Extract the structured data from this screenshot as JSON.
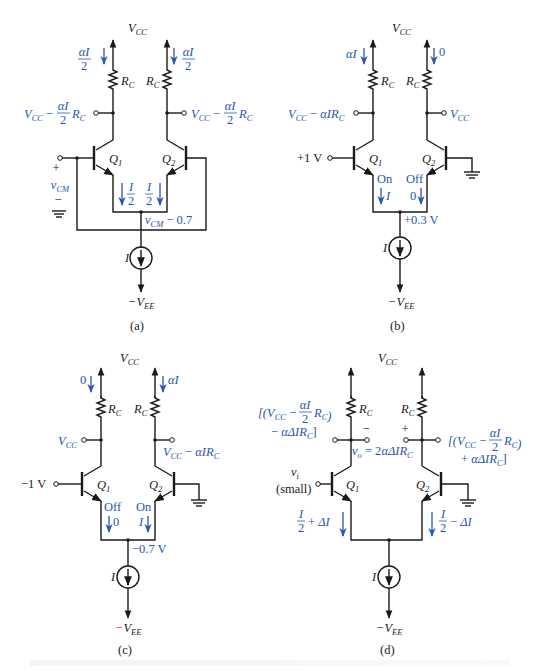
{
  "figure": {
    "panels": [
      {
        "id": "a",
        "caption": "(a)",
        "supply_top": "V",
        "supply_top_sub": "CC",
        "supply_bottom": "−V",
        "supply_bottom_sub": "EE",
        "left_rc": "R",
        "right_rc": "R",
        "rc_sub": "C",
        "q1": "Q",
        "q1_sub": "1",
        "q2": "Q",
        "q2_sub": "2",
        "left_collector_current": "αI/2",
        "right_collector_current": "αI/2",
        "left_collector_voltage": "V_CC − (αI/2) R_C",
        "right_collector_voltage": "V_CC − (αI/2) R_C",
        "left_emitter_current": "I/2",
        "right_emitter_current": "I/2",
        "emitter_node_voltage": "v_CM − 0.7",
        "input_label": "v_CM",
        "input_plus": "+",
        "input_minus": "−",
        "source_label": "I"
      },
      {
        "id": "b",
        "caption": "(b)",
        "supply_top": "V",
        "supply_top_sub": "CC",
        "supply_bottom": "−V",
        "supply_bottom_sub": "EE",
        "left_collector_current": "αI",
        "right_collector_current": "0",
        "left_collector_voltage": "V_CC − αIR_C",
        "right_collector_voltage": "V_CC",
        "input_label": "+1 V",
        "q1_state": "On",
        "q2_state": "Off",
        "left_emitter_current": "I",
        "right_emitter_current": "0",
        "emitter_node_voltage": "+0.3 V",
        "source_label": "I"
      },
      {
        "id": "c",
        "caption": "(c)",
        "supply_top": "V",
        "supply_top_sub": "CC",
        "supply_bottom": "−V",
        "supply_bottom_sub": "EE",
        "left_collector_current": "0",
        "right_collector_current": "αI",
        "left_collector_voltage": "V_CC",
        "right_collector_voltage": "V_CC − αIR_C",
        "input_label": "−1 V",
        "q1_state": "Off",
        "q2_state": "On",
        "left_emitter_current": "0",
        "right_emitter_current": "I",
        "emitter_node_voltage": "−0.7 V",
        "source_label": "I"
      },
      {
        "id": "d",
        "caption": "(d)",
        "supply_top": "V",
        "supply_top_sub": "CC",
        "supply_bottom": "−V",
        "supply_bottom_sub": "EE",
        "left_collector_voltage_l1": "[(V_CC − (αI/2) R_C)",
        "left_collector_voltage_l2": "− αΔIR_C]",
        "right_collector_voltage_l1": "[(V_CC − (αI/2) R_C)",
        "right_collector_voltage_l2": "+ αΔIR_C]",
        "output_minus": "−",
        "output_plus": "+",
        "output_voltage": "v_o = 2αΔIR_C",
        "input_label": "v_i",
        "input_note": "(small)",
        "left_emitter_current": "I/2 + ΔI",
        "right_emitter_current": "I/2 − ΔI",
        "source_label": "I"
      }
    ],
    "colors": {
      "annotation": "#2a55b0",
      "wire": "#1a1a1a",
      "highlight_minus": "#d0342c"
    }
  }
}
